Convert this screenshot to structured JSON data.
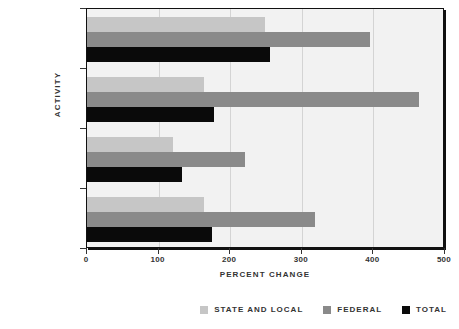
{
  "chart_data": {
    "type": "bar",
    "orientation": "horizontal",
    "title": "",
    "xlabel": "Percent Change",
    "ylabel": "Activity",
    "xlim": [
      0,
      500
    ],
    "xticks": [
      0,
      100,
      200,
      300,
      400,
      500
    ],
    "xtick_labels": [
      "0",
      "100",
      "200",
      "300",
      "400",
      "500"
    ],
    "categories": [
      "Corrections",
      "Legal",
      "Police",
      "Total"
    ],
    "grid": true,
    "legend_position": "bottom-right",
    "series": [
      {
        "name": "State and local",
        "color": "#c6c6c6",
        "values": [
          248,
          164,
          120,
          163
        ]
      },
      {
        "name": "Federal",
        "color": "#8a8a8a",
        "values": [
          395,
          463,
          220,
          318
        ]
      },
      {
        "name": "Total",
        "color": "#0a0a0a",
        "values": [
          255,
          177,
          132,
          174
        ]
      }
    ]
  },
  "legend": {
    "items": [
      {
        "label": "State and local",
        "color": "#c6c6c6"
      },
      {
        "label": "Federal",
        "color": "#8a8a8a"
      },
      {
        "label": "Total",
        "color": "#0a0a0a"
      }
    ]
  },
  "axes": {
    "x_title": "Percent Change",
    "y_title": "Activity"
  },
  "colors": {
    "plot_background": "#f2f2f2",
    "axis": "#333333",
    "gridline": "#d4d4d4",
    "page_background": "#ffffff"
  }
}
